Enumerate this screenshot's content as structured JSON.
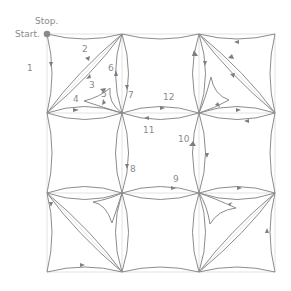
{
  "diagram": {
    "start_label": "Start.",
    "stop_label": "Stop.",
    "colors": {
      "line": "#8c8c8c",
      "grid": "#dcdcdc",
      "start_dot": "#8a8a8a",
      "text": "#8a8a8a"
    },
    "grid": {
      "xs": [
        47,
        122,
        199,
        275
      ],
      "ys": [
        34,
        113,
        193,
        272
      ]
    },
    "step_labels": [
      {
        "n": "1",
        "x": 27,
        "y": 71
      },
      {
        "n": "2",
        "x": 82,
        "y": 52
      },
      {
        "n": "3",
        "x": 89,
        "y": 88
      },
      {
        "n": "4",
        "x": 73,
        "y": 102
      },
      {
        "n": "5",
        "x": 101,
        "y": 97
      },
      {
        "n": "6",
        "x": 108,
        "y": 71
      },
      {
        "n": "7",
        "x": 128,
        "y": 98
      },
      {
        "n": "8",
        "x": 130,
        "y": 172
      },
      {
        "n": "9",
        "x": 173,
        "y": 182
      },
      {
        "n": "10",
        "x": 178,
        "y": 142
      },
      {
        "n": "11",
        "x": 143,
        "y": 133
      },
      {
        "n": "12",
        "x": 163,
        "y": 100
      }
    ]
  }
}
